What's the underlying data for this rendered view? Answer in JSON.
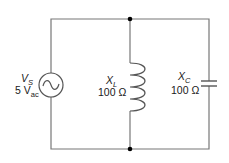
{
  "diagram": {
    "type": "parallel LC circuit",
    "colors": {
      "wire": "#777777",
      "component": "#555555",
      "node": "#000000",
      "text": "#1a1a1a"
    },
    "source": {
      "symbol": "V",
      "subscript": "S",
      "value": "5 V",
      "value_subscript": "ac",
      "icon": "ac-voltage-source-icon"
    },
    "inductor": {
      "symbol": "X",
      "subscript": "L",
      "value": "100 Ω",
      "icon": "inductor-coil-icon"
    },
    "capacitor": {
      "symbol": "X",
      "subscript": "C",
      "value": "100 Ω",
      "icon": "capacitor-icon"
    },
    "nodes": [
      {
        "name": "top-junction",
        "x": 130,
        "y": 19
      },
      {
        "name": "bottom-junction",
        "x": 130,
        "y": 149
      }
    ]
  }
}
